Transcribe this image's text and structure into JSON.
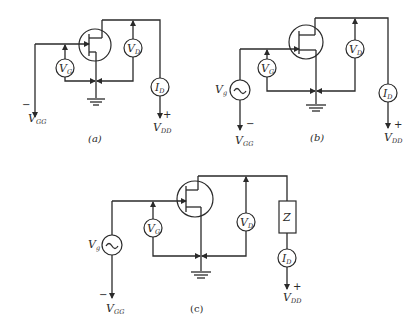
{
  "diagram": {
    "type": "circuit-schematic",
    "colors": {
      "ink": "#2a2a2a",
      "background": "#ffffff"
    },
    "panels": [
      {
        "id": "a",
        "caption": "(a)",
        "components": [
          "JFET",
          "VG voltmeter",
          "VD voltmeter",
          "ID ammeter",
          "ground"
        ],
        "labels": {
          "vg_meter": "V",
          "vg_meter_sub": "G",
          "vd_meter": "V",
          "vd_meter_sub": "D",
          "id_meter": "I",
          "id_meter_sub": "D",
          "vgg": "V",
          "vgg_sub": "GG",
          "vgg_sign": "−",
          "vdd": "V",
          "vdd_sub": "DD",
          "vdd_sign": "+"
        }
      },
      {
        "id": "b",
        "caption": "(b)",
        "components": [
          "JFET",
          "AC source Vg",
          "VG voltmeter",
          "VD voltmeter",
          "ID ammeter",
          "ground"
        ],
        "labels": {
          "source": "V",
          "source_sub": "g",
          "source_symbol": "~",
          "vg_meter": "V",
          "vg_meter_sub": "G",
          "vd_meter": "V",
          "vd_meter_sub": "D",
          "id_meter": "I",
          "id_meter_sub": "D",
          "vgg": "V",
          "vgg_sub": "GG",
          "vgg_sign": "−",
          "vdd": "V",
          "vdd_sub": "DD",
          "vdd_sign": "+"
        }
      },
      {
        "id": "c",
        "caption": "(c)",
        "components": [
          "JFET",
          "AC source Vg",
          "VG voltmeter",
          "VD voltmeter",
          "load impedance Z",
          "ID ammeter",
          "ground"
        ],
        "labels": {
          "source": "V",
          "source_sub": "g",
          "source_symbol": "~",
          "vg_meter": "V",
          "vg_meter_sub": "G",
          "vd_meter": "V",
          "vd_meter_sub": "D",
          "load": "Z",
          "id_meter": "I",
          "id_meter_sub": "D",
          "vgg": "V",
          "vgg_sub": "GG",
          "vgg_sign": "−",
          "vdd": "V",
          "vdd_sub": "DD",
          "vdd_sign": "+"
        }
      }
    ]
  }
}
